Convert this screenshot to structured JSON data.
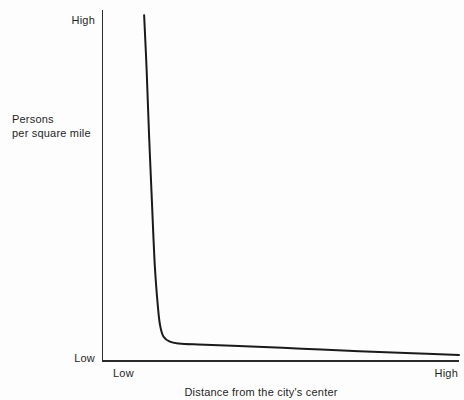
{
  "chart_data": {
    "type": "line",
    "title": "",
    "subtitle": "",
    "xlabel": "Distance from the city's center",
    "ylabel": "Persons per square mile",
    "ylabel_lines": [
      "Persons",
      "per square mile"
    ],
    "xticklabels": [
      "Low",
      "High"
    ],
    "yticklabels": [
      "High",
      "Low"
    ],
    "xlim": [
      "Low",
      "High"
    ],
    "ylim": [
      "Low",
      "High"
    ],
    "grid": false,
    "legend": null,
    "annotations": [],
    "series": [
      {
        "name": "Population density gradient",
        "color": "#1a1a1a",
        "linewidth": 2,
        "description": "Steep negative-exponential decay: density is very high at the city center, falls almost vertically over a short distance, then flattens into a long gently declining tail.",
        "points": [
          {
            "x": 0.118,
            "y": 0.985
          },
          {
            "x": 0.125,
            "y": 0.83
          },
          {
            "x": 0.132,
            "y": 0.64
          },
          {
            "x": 0.14,
            "y": 0.45
          },
          {
            "x": 0.148,
            "y": 0.27
          },
          {
            "x": 0.157,
            "y": 0.15
          },
          {
            "x": 0.163,
            "y": 0.1
          },
          {
            "x": 0.172,
            "y": 0.07
          },
          {
            "x": 0.19,
            "y": 0.055
          },
          {
            "x": 0.215,
            "y": 0.05
          },
          {
            "x": 0.27,
            "y": 0.047
          },
          {
            "x": 0.4,
            "y": 0.042
          },
          {
            "x": 0.56,
            "y": 0.035
          },
          {
            "x": 0.72,
            "y": 0.028
          },
          {
            "x": 0.87,
            "y": 0.022
          },
          {
            "x": 1.0,
            "y": 0.017
          }
        ]
      }
    ],
    "axes": {
      "y_axis_name": "y-axis-line",
      "x_axis_name": "x-axis-line",
      "axis_color": "#2b2b2b"
    }
  },
  "yaxis": {
    "tick_high": "High",
    "tick_low": "Low",
    "title_line1": "Persons",
    "title_line2": "per square mile"
  },
  "xaxis": {
    "tick_low": "Low",
    "tick_high": "High",
    "title": "Distance from the city's center"
  },
  "colors": {
    "background": "#fdfdfd",
    "axis": "#2b2b2b",
    "curve": "#1a1a1a",
    "text": "#1f1f1f"
  }
}
